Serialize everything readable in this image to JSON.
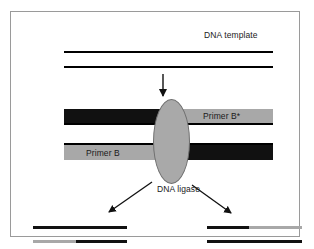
{
  "figure": {
    "frame_border_color": "#9a9a9a",
    "background": "#ffffff"
  },
  "labels": {
    "dna_template": "DNA template",
    "primer_b_star": "Primer B*",
    "primer_b": "Primer B",
    "dna_ligase": "DNA ligase"
  },
  "colors": {
    "strand_dark": "#111111",
    "strand_gray": "#a8a8a8",
    "ligase_fill": "#a9a9a9",
    "ligase_stroke": "#6f6f6f",
    "line_black": "#000000",
    "text": "#1a1a1a"
  },
  "icons": {
    "down_arrow": "arrow-down-icon",
    "left_arrow": "arrow-down-left-icon",
    "right_arrow": "arrow-down-right-icon",
    "ligase_shape": "ellipse-icon"
  },
  "diagram": {
    "template_strands": [
      {
        "name": "template-strand-top",
        "style": "black-line"
      },
      {
        "name": "template-strand-bottom",
        "style": "black-line"
      }
    ],
    "duplex_top": {
      "left_segment": {
        "fill": "dark",
        "label": ""
      },
      "right_segment": {
        "fill": "gray",
        "label": "Primer B*"
      },
      "backbone": "black-line-below"
    },
    "duplex_bottom": {
      "left_segment": {
        "fill": "gray",
        "label": "Primer B"
      },
      "right_segment": {
        "fill": "dark",
        "label": ""
      },
      "backbone": "black-line-above"
    },
    "products": [
      {
        "name": "product-left",
        "strands": [
          {
            "segments": [
              {
                "fill": "dark",
                "frac": 1.0
              }
            ]
          },
          {
            "segments": [
              {
                "fill": "gray",
                "frac": 0.45
              },
              {
                "fill": "dark",
                "frac": 0.55
              }
            ]
          }
        ]
      },
      {
        "name": "product-right",
        "strands": [
          {
            "segments": [
              {
                "fill": "dark",
                "frac": 0.45
              },
              {
                "fill": "gray",
                "frac": 0.55
              }
            ]
          },
          {
            "segments": [
              {
                "fill": "dark",
                "frac": 1.0
              }
            ]
          }
        ]
      }
    ]
  }
}
